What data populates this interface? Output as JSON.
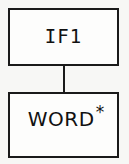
{
  "diagram": {
    "type": "tree-fragment",
    "background_color": "#f7f7f5",
    "line_color": "#1a1a1a",
    "nodes": [
      {
        "id": "if1",
        "label": "IF1",
        "role": "parent-node"
      },
      {
        "id": "word",
        "label": "WORD",
        "superscript": "*",
        "role": "child-node"
      }
    ],
    "edges": [
      {
        "from": "IF1",
        "to": "WORD*",
        "style": "straight-vertical-line"
      }
    ]
  }
}
